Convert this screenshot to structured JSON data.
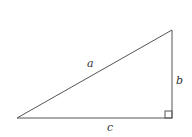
{
  "diagram": {
    "type": "right-triangle",
    "vertices": {
      "left": {
        "x": 17,
        "y": 118
      },
      "top_right": {
        "x": 172,
        "y": 30
      },
      "bottom_right": {
        "x": 172,
        "y": 118
      }
    },
    "right_angle_marker": {
      "x": 165,
      "y": 111,
      "size": 7
    },
    "labels": {
      "hypotenuse": {
        "text": "a",
        "x": 87,
        "y": 67
      },
      "vertical_leg": {
        "text": "b",
        "x": 176,
        "y": 84
      },
      "horizontal_leg": {
        "text": "c",
        "x": 107,
        "y": 131
      }
    },
    "colors": {
      "stroke": "#555555",
      "text": "#333333",
      "background": "#ffffff"
    }
  }
}
